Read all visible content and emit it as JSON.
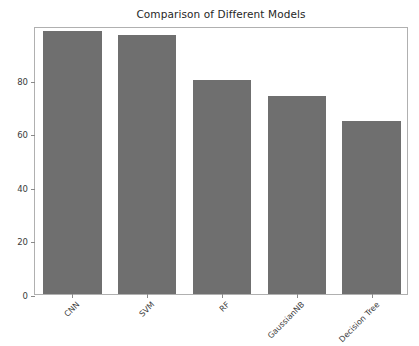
{
  "chart_data": {
    "type": "bar",
    "title": "Comparison of Different Models",
    "xlabel": "",
    "ylabel": "",
    "categories": [
      "CNN",
      "SVM",
      "RF",
      "GaussianNB",
      "Decision Tree"
    ],
    "values": [
      98,
      96.5,
      80,
      74,
      64.5
    ],
    "series": [
      {
        "name": "Accuracy",
        "values": [
          98,
          96.5,
          80,
          74,
          64.5
        ]
      }
    ],
    "ylim": [
      0,
      100
    ],
    "yticks": [
      0,
      20,
      40,
      60,
      80
    ],
    "yticklabels": [
      "0",
      "20",
      "40",
      "60",
      "80"
    ],
    "xticklabels": [
      "CNN",
      "SVM",
      "RF",
      "GaussianNB",
      "Decision Tree"
    ],
    "xtick_rotation": 45,
    "grid": false,
    "legend": null,
    "legend_position": "none",
    "bar_color": "#6f6f6f",
    "frame_color": "#b0b0b0",
    "text_color": "#3b3b3b",
    "background": "#ffffff"
  }
}
